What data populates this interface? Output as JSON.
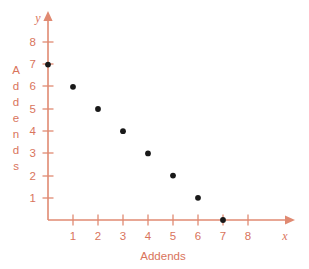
{
  "chart_data": {
    "type": "scatter",
    "title": "",
    "xlabel": "Addends",
    "ylabel": "Addends",
    "x_axis_variable": "x",
    "y_axis_variable": "y",
    "xlim": [
      0,
      8.8
    ],
    "ylim": [
      0,
      8.8
    ],
    "x_ticks": [
      1,
      2,
      3,
      4,
      5,
      6,
      7,
      8
    ],
    "y_ticks": [
      1,
      2,
      3,
      4,
      5,
      6,
      7,
      8
    ],
    "x_tick_labels": [
      "1",
      "2",
      "3",
      "4",
      "5",
      "6",
      "7",
      "8"
    ],
    "y_tick_labels": [
      "1",
      "2",
      "3",
      "4",
      "5",
      "6",
      "7",
      "8"
    ],
    "grid": false,
    "legend": null,
    "points": [
      {
        "x": 0,
        "y": 7
      },
      {
        "x": 1,
        "y": 6
      },
      {
        "x": 2,
        "y": 5
      },
      {
        "x": 3,
        "y": 4
      },
      {
        "x": 4,
        "y": 3
      },
      {
        "x": 5,
        "y": 2
      },
      {
        "x": 6,
        "y": 1
      },
      {
        "x": 7,
        "y": 0
      }
    ],
    "series": [
      {
        "name": "Addends",
        "x": [
          0,
          1,
          2,
          3,
          4,
          5,
          6,
          7
        ],
        "values": [
          7,
          6,
          5,
          4,
          3,
          2,
          1,
          0
        ]
      }
    ],
    "colors": {
      "axis": "#e08a72",
      "tick_label": "#d9745c",
      "axis_label": "#d9745c",
      "point": "#191919",
      "background": "#ffffff"
    }
  },
  "y_label_letters": [
    "A",
    "d",
    "d",
    "e",
    "n",
    "d",
    "s"
  ]
}
